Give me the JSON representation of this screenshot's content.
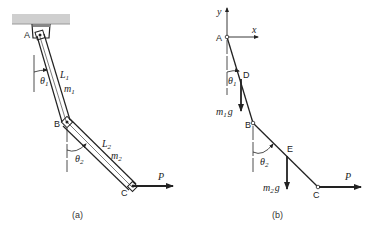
{
  "figure": {
    "panel_a": {
      "caption": "(a)",
      "points": {
        "A": "A",
        "B": "B",
        "C": "C"
      },
      "link1": {
        "length": "L",
        "length_sub": "1",
        "mass": "m",
        "mass_sub": "1",
        "angle": "θ",
        "angle_sub": "1"
      },
      "link2": {
        "length": "L",
        "length_sub": "2",
        "mass": "m",
        "mass_sub": "2",
        "angle": "θ",
        "angle_sub": "2"
      },
      "force": "P"
    },
    "panel_b": {
      "caption": "(b)",
      "axes": {
        "x": "x",
        "y": "y"
      },
      "points": {
        "A": "A",
        "B": "B",
        "C": "C",
        "D": "D",
        "E": "E"
      },
      "angle1": {
        "sym": "θ",
        "sub": "1"
      },
      "angle2": {
        "sym": "θ",
        "sub": "2"
      },
      "weight1": {
        "m": "m",
        "sub": "1",
        "g": "g"
      },
      "weight2": {
        "m": "m",
        "sub": "2",
        "g": "g"
      },
      "force": "P"
    },
    "colors": {
      "line": "#222222",
      "ceiling": "#cfcfcf"
    }
  }
}
